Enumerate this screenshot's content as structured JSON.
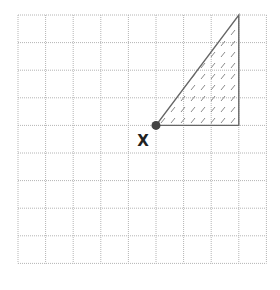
{
  "diagram": {
    "type": "grid-figure",
    "grid": {
      "columns": 9,
      "rows": 9,
      "origin_px": [
        18,
        15
      ],
      "cell_px": 27.6,
      "line_color": "#b4b4b4",
      "line_style": "dotted"
    },
    "shape": {
      "kind": "right-triangle",
      "vertices_grid": [
        [
          5,
          4
        ],
        [
          8,
          4
        ],
        [
          8,
          0
        ]
      ],
      "stroke_color": "#666666",
      "hatch_color": "#8a8a8a",
      "hatch_style": "short diagonal dashes"
    },
    "point": {
      "label": "X",
      "grid": [
        5,
        4
      ],
      "color": "#444444"
    }
  }
}
